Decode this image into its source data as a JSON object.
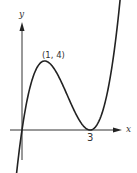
{
  "chart_data": {
    "type": "line",
    "title": "",
    "xlabel": "x",
    "ylabel": "y",
    "function": "y = x(x-3)^2",
    "annotations": [
      {
        "text": "(1, 4)",
        "x": 1,
        "y": 4,
        "note": "local maximum"
      },
      {
        "text": "3",
        "x": 3,
        "y": 0,
        "note": "x-intercept / local minimum"
      }
    ],
    "series": [
      {
        "name": "curve",
        "x": [
          -0.3,
          0,
          0.5,
          1,
          1.5,
          2,
          2.5,
          3,
          3.5,
          4,
          4.3
        ],
        "y": [
          -2.97,
          0,
          3.125,
          4,
          3.375,
          2,
          0.625,
          0,
          0.875,
          4,
          7.27
        ]
      }
    ],
    "xlim": [
      -0.5,
      4.6
    ],
    "ylim": [
      -2.5,
      7
    ],
    "grid": false,
    "legend": "none"
  },
  "labels": {
    "y_axis": "y",
    "x_axis": "x",
    "max_point": "(1, 4)",
    "root": "3"
  }
}
